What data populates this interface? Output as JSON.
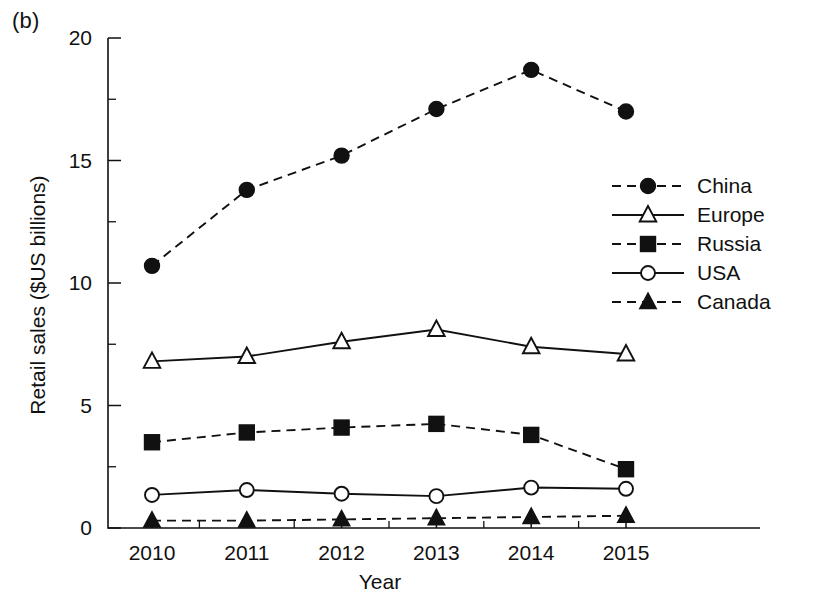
{
  "panel": {
    "label": "(b)"
  },
  "axes": {
    "xlabel": "Year",
    "ylabel": "Retail sales ($US billions)",
    "y_ticks": [
      "0",
      "5",
      "10",
      "15",
      "20"
    ],
    "x_ticks": [
      "2010",
      "2011",
      "2012",
      "2013",
      "2014",
      "2015"
    ]
  },
  "legend": {
    "entries": [
      {
        "label": "China",
        "marker": "filled-circle",
        "line": "dashed"
      },
      {
        "label": "Europe",
        "marker": "open-triangle",
        "line": "solid"
      },
      {
        "label": "Russia",
        "marker": "filled-square",
        "line": "dashed"
      },
      {
        "label": "USA",
        "marker": "open-circle",
        "line": "solid"
      },
      {
        "label": "Canada",
        "marker": "filled-triangle",
        "line": "dashed"
      }
    ]
  },
  "colors": {
    "ink": "#111111",
    "background": "#ffffff"
  },
  "chart_data": {
    "type": "line",
    "title": "",
    "xlabel": "Year",
    "ylabel": "Retail sales ($US billions)",
    "categories": [
      "2010",
      "2011",
      "2012",
      "2013",
      "2014",
      "2015"
    ],
    "x": [
      2010,
      2011,
      2012,
      2013,
      2014,
      2015
    ],
    "xlim": [
      2009.6,
      2015.4
    ],
    "ylim": [
      0,
      20
    ],
    "y_ticks_major": [
      0,
      5,
      10,
      15,
      20
    ],
    "y_ticks_minor": [
      2.5,
      7.5,
      12.5,
      17.5
    ],
    "grid": false,
    "legend_position": "center-right",
    "series": [
      {
        "name": "China",
        "marker": "filled-circle",
        "line": "dashed",
        "values": [
          10.7,
          13.8,
          15.2,
          17.1,
          18.7,
          17.0
        ]
      },
      {
        "name": "Europe",
        "marker": "open-triangle",
        "line": "solid",
        "values": [
          6.8,
          7.0,
          7.6,
          8.1,
          7.4,
          7.1
        ]
      },
      {
        "name": "Russia",
        "marker": "filled-square",
        "line": "dashed",
        "values": [
          3.5,
          3.9,
          4.1,
          4.25,
          3.8,
          2.4
        ]
      },
      {
        "name": "USA",
        "marker": "open-circle",
        "line": "solid",
        "values": [
          1.35,
          1.55,
          1.4,
          1.3,
          1.65,
          1.6
        ]
      },
      {
        "name": "Canada",
        "marker": "filled-triangle",
        "line": "dashed",
        "values": [
          0.3,
          0.3,
          0.35,
          0.4,
          0.45,
          0.5
        ]
      }
    ]
  }
}
